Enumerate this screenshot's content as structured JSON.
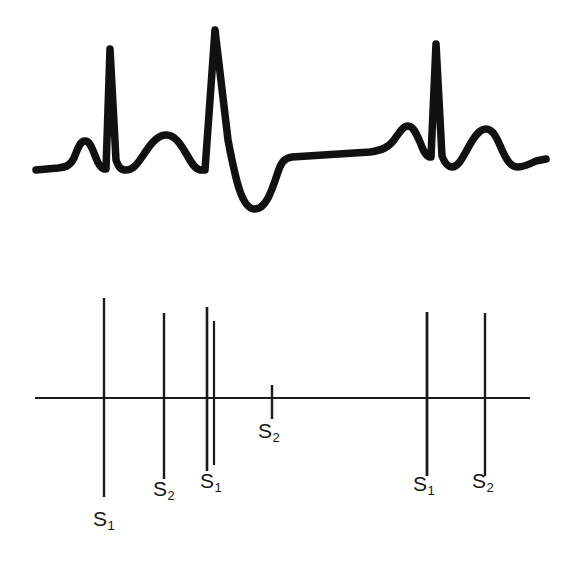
{
  "figure": {
    "background_color": "#ffffff",
    "ink_color": "#111111"
  },
  "ecg_panel": {
    "name": "electrocardiogram-tracing",
    "description": "Hand-drawn thick black ECG tracing showing three beats with P waves, R spikes, T waves and a wide deep QRS complex in the middle beat",
    "stroke_color": "#111111",
    "stroke_width": 7,
    "baseline_y": 155
  },
  "sound_panel": {
    "name": "heart-sound-timing-diagram",
    "baseline_y": 398,
    "baseline_x_start": 35,
    "baseline_x_end": 530,
    "axis_stroke_color": "#1a1a1a",
    "axis_stroke_width": 2.2,
    "marks": [
      {
        "id": "mark-1",
        "x": 104,
        "top_y": 298,
        "bottom_y": 497,
        "stroke_width": 2.4
      },
      {
        "id": "mark-2",
        "x": 164,
        "top_y": 313,
        "bottom_y": 479,
        "stroke_width": 2.4
      },
      {
        "id": "mark-3",
        "x": 207,
        "top_y": 307,
        "bottom_y": 471,
        "stroke_width": 2.6
      },
      {
        "id": "mark-4",
        "x": 214,
        "top_y": 321,
        "bottom_y": 465,
        "stroke_width": 2.2
      },
      {
        "id": "mark-5",
        "x": 272,
        "top_y": 385,
        "bottom_y": 419,
        "stroke_width": 2.4
      },
      {
        "id": "mark-6",
        "x": 427,
        "top_y": 312,
        "bottom_y": 476,
        "stroke_width": 2.8
      },
      {
        "id": "mark-7",
        "x": 485,
        "top_y": 313,
        "bottom_y": 476,
        "stroke_width": 2.4
      }
    ],
    "labels": [
      {
        "id": "label-s1-first",
        "text": "S",
        "subscript": "1",
        "x": 93,
        "y": 508
      },
      {
        "id": "label-s2-first",
        "text": "S",
        "subscript": "2",
        "x": 153,
        "y": 478
      },
      {
        "id": "label-s1-second",
        "text": "S",
        "subscript": "1",
        "x": 200,
        "y": 470
      },
      {
        "id": "label-s2-second",
        "text": "S",
        "subscript": "2",
        "x": 258,
        "y": 420
      },
      {
        "id": "label-s1-third",
        "text": "S",
        "subscript": "1",
        "x": 413,
        "y": 473
      },
      {
        "id": "label-s2-third",
        "text": "S",
        "subscript": "2",
        "x": 472,
        "y": 470
      }
    ]
  },
  "chart_data": {
    "type": "line",
    "xlabel": "",
    "ylabel": "",
    "grid": false,
    "legend": null,
    "series": [
      {
        "name": "ECG tracing",
        "waveform_features": [
          {
            "feature": "baseline",
            "x": 35,
            "y": 0
          },
          {
            "feature": "P-wave-peak",
            "x": 85,
            "y": 28
          },
          {
            "feature": "R-spike-1-peak",
            "x": 110,
            "y": 108
          },
          {
            "feature": "T-wave-1-peak",
            "x": 165,
            "y": 32
          },
          {
            "feature": "R-spike-2-peak",
            "x": 215,
            "y": 128
          },
          {
            "feature": "S-wave-2-trough",
            "x": 255,
            "y": -58
          },
          {
            "feature": "ST-segment-plateau",
            "x": 330,
            "y": 8
          },
          {
            "feature": "P-wave-3-peak",
            "x": 405,
            "y": 32
          },
          {
            "feature": "R-spike-3-peak",
            "x": 435,
            "y": 112
          },
          {
            "feature": "T-wave-3-peak",
            "x": 483,
            "y": 32
          },
          {
            "feature": "baseline-end",
            "x": 545,
            "y": 6
          }
        ]
      },
      {
        "name": "Heart sound marks",
        "categories": [
          "S1",
          "S2",
          "S1",
          "S1-split",
          "S2",
          "S1",
          "S2"
        ],
        "x_positions": [
          104,
          164,
          207,
          214,
          272,
          427,
          485
        ],
        "amplitudes": [
          199,
          166,
          164,
          144,
          34,
          164,
          163
        ]
      }
    ]
  }
}
